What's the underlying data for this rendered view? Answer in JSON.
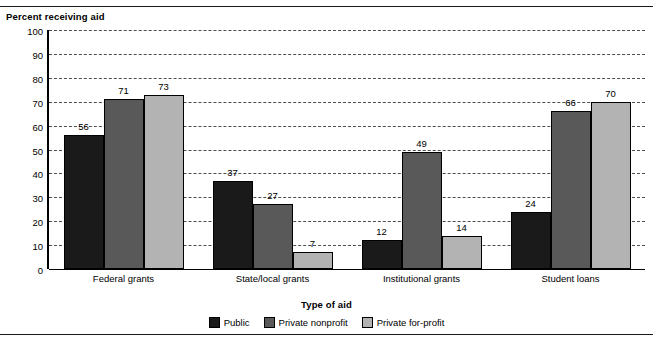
{
  "chart_data": {
    "type": "bar",
    "title": "",
    "ylabel": "Percent receiving aid",
    "xlabel": "Type of aid",
    "categories": [
      "Federal grants",
      "State/local grants",
      "Institutional grants",
      "Student loans"
    ],
    "series": [
      {
        "name": "Public",
        "color": "#1a1a1a",
        "values": [
          56,
          37,
          12,
          24
        ]
      },
      {
        "name": "Private nonprofit",
        "color": "#595959",
        "values": [
          71,
          27,
          49,
          66
        ]
      },
      {
        "name": "Private for-profit",
        "color": "#b3b3b3",
        "values": [
          73,
          7,
          14,
          70
        ]
      }
    ],
    "ylim": [
      0,
      100
    ],
    "yticks": [
      100,
      90,
      80,
      70,
      60,
      50,
      40,
      30,
      20,
      10,
      0
    ],
    "grid": "horizontal-dashed",
    "legend_position": "bottom-center",
    "value_labels": true
  }
}
